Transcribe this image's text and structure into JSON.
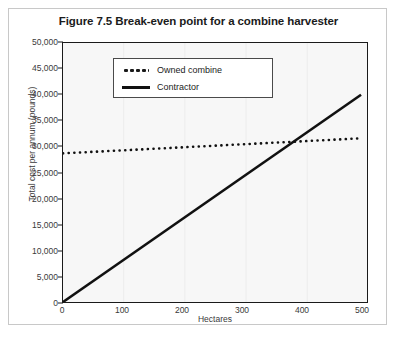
{
  "figure": {
    "title": "Figure 7.5 Break-even point for a combine harvester"
  },
  "axes": {
    "xlabel": "Hectares",
    "ylabel": "Total cost per annum (pounds)",
    "xticks": [
      "0",
      "100",
      "200",
      "300",
      "400",
      "500"
    ],
    "yticks": [
      "0",
      "5,000",
      "10,000",
      "15,000",
      "20,000",
      "25,000",
      "30,000",
      "35,000",
      "40,000",
      "45,000",
      "50,000"
    ]
  },
  "legend": {
    "items": [
      {
        "label": "Owned combine",
        "style": "dotted",
        "color": "#1a1a1a"
      },
      {
        "label": "Contractor",
        "style": "solid",
        "color": "#111111"
      }
    ]
  },
  "colors": {
    "line": "#111111",
    "plot_border": "#1a1a1a",
    "plot_background": "#f7f7f7",
    "frame_border": "#c8c8c8",
    "text": "#3a3a3a"
  },
  "chart_data": {
    "type": "line",
    "title": "Figure 7.5 Break-even point for a combine harvester",
    "xlabel": "Hectares",
    "ylabel": "Total cost per annum (pounds)",
    "xlim": [
      0,
      510
    ],
    "ylim": [
      0,
      50000
    ],
    "xticks": [
      0,
      100,
      200,
      300,
      400,
      500
    ],
    "yticks": [
      0,
      5000,
      10000,
      15000,
      20000,
      25000,
      30000,
      35000,
      40000,
      45000,
      50000
    ],
    "grid": "vertical-faint",
    "legend_position": "upper-left-inside",
    "series": [
      {
        "name": "Owned combine",
        "style": "dotted",
        "x": [
          0,
          500
        ],
        "y": [
          28700,
          31600
        ]
      },
      {
        "name": "Contractor",
        "style": "solid",
        "x": [
          0,
          500
        ],
        "y": [
          0,
          40000
        ]
      }
    ],
    "annotations": [
      {
        "name": "break-even-point",
        "x": 400,
        "y": 31000,
        "note": "Lines intersect near 400 hectares"
      }
    ]
  }
}
